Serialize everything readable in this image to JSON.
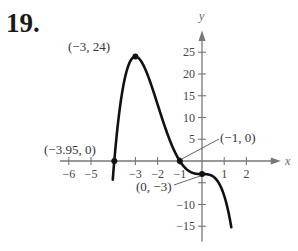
{
  "problem_number": "19.",
  "chart_data": {
    "type": "line",
    "title": "",
    "function": "f(x) = -x^4 - 4x^3 - 3",
    "xlabel": "x",
    "ylabel": "y",
    "xlim": [
      -6.5,
      3
    ],
    "ylim": [
      -17,
      29
    ],
    "x_ticks": [
      -6,
      -5,
      -3,
      -2,
      -1,
      1,
      2
    ],
    "x_tick_labels": [
      "−6",
      "−5",
      "−3",
      "−2",
      "−1",
      "1",
      "2"
    ],
    "y_ticks": [
      25,
      20,
      15,
      10,
      5,
      -10,
      -15
    ],
    "y_tick_labels": [
      "25",
      "20",
      "15",
      "10",
      "5",
      "−10",
      "−15"
    ],
    "grid": false,
    "series": [
      {
        "name": "f(x)",
        "x": [
          -4.0,
          -3.95,
          -3.8,
          -3.5,
          -3.0,
          -2.5,
          -2.0,
          -1.5,
          -1.0,
          -0.5,
          0.0,
          0.5,
          1.0,
          1.3
        ],
        "values": [
          -3.0,
          0.05,
          9.4,
          21.8,
          24.0,
          16.6,
          13.0,
          5.4,
          0.0,
          -2.56,
          -3.0,
          -3.56,
          -8.0,
          -14.6
        ]
      }
    ],
    "annotations": [
      {
        "label": "(−3, 24)",
        "x": -3,
        "y": 24
      },
      {
        "label": "(−3.95, 0)",
        "x": -3.95,
        "y": 0
      },
      {
        "label": "(−1, 0)",
        "x": -1,
        "y": 0
      },
      {
        "label": "(0, −3)",
        "x": 0,
        "y": -3
      }
    ]
  }
}
